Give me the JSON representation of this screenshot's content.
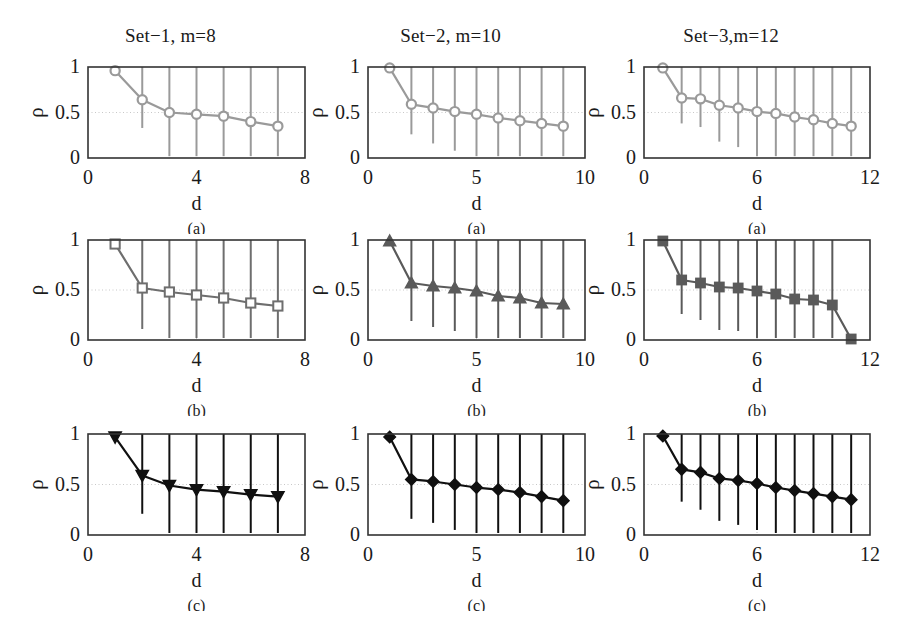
{
  "figure": {
    "background": "#ffffff",
    "rows": [
      "(a)",
      "(b)",
      "(c)"
    ],
    "columns": 3
  },
  "chart_data": [
    {
      "id": "panel-a1",
      "type": "line",
      "title": "Set−1, m=8",
      "subcaption": "(a)",
      "xlabel": "d",
      "ylabel": "ρ",
      "xlim": [
        0,
        8
      ],
      "ylim": [
        0,
        1
      ],
      "xticks": [
        0,
        4,
        8
      ],
      "xticklabels": [
        "0",
        "4",
        "8"
      ],
      "yticks": [
        0,
        0.5,
        1
      ],
      "yticklabels": [
        "0",
        "0.5",
        "1"
      ],
      "grid": true,
      "marker": "circle-open",
      "color": "#9a9a9a",
      "x": [
        1,
        2,
        3,
        4,
        5,
        6,
        7
      ],
      "values": [
        0.96,
        0.64,
        0.5,
        0.48,
        0.46,
        0.4,
        0.35
      ],
      "err_low": [
        0.93,
        0.33,
        0.02,
        0.02,
        0.02,
        0.02,
        0.02
      ],
      "err_high": [
        1.0,
        1.0,
        1.0,
        1.0,
        1.0,
        1.0,
        1.0
      ]
    },
    {
      "id": "panel-a2",
      "type": "line",
      "title": "Set−2, m=10",
      "subcaption": "(a)",
      "xlabel": "d",
      "ylabel": "ρ",
      "xlim": [
        0,
        10
      ],
      "ylim": [
        0,
        1
      ],
      "xticks": [
        0,
        5,
        10
      ],
      "xticklabels": [
        "0",
        "5",
        "10"
      ],
      "yticks": [
        0,
        0.5,
        1
      ],
      "yticklabels": [
        "0",
        "0.5",
        "1"
      ],
      "grid": true,
      "marker": "circle-open",
      "color": "#9a9a9a",
      "x": [
        1,
        2,
        3,
        4,
        5,
        6,
        7,
        8,
        9
      ],
      "values": [
        0.99,
        0.59,
        0.55,
        0.51,
        0.48,
        0.44,
        0.41,
        0.38,
        0.35
      ],
      "err_low": [
        0.97,
        0.26,
        0.16,
        0.08,
        0.02,
        0.02,
        0.02,
        0.02,
        0.02
      ],
      "err_high": [
        1.0,
        1.0,
        1.0,
        1.0,
        1.0,
        1.0,
        1.0,
        1.0,
        1.0
      ]
    },
    {
      "id": "panel-a3",
      "type": "line",
      "title": "Set−3,m=12",
      "subcaption": "(a)",
      "xlabel": "d",
      "ylabel": "ρ",
      "xlim": [
        0,
        12
      ],
      "ylim": [
        0,
        1
      ],
      "xticks": [
        0,
        6,
        12
      ],
      "xticklabels": [
        "0",
        "6",
        "12"
      ],
      "yticks": [
        0,
        0.5,
        1
      ],
      "yticklabels": [
        "0",
        "0.5",
        "1"
      ],
      "grid": true,
      "marker": "circle-open",
      "color": "#9a9a9a",
      "x": [
        1,
        2,
        3,
        4,
        5,
        6,
        7,
        8,
        9,
        10,
        11
      ],
      "values": [
        0.99,
        0.66,
        0.65,
        0.58,
        0.55,
        0.51,
        0.49,
        0.45,
        0.42,
        0.38,
        0.35
      ],
      "err_low": [
        0.97,
        0.38,
        0.34,
        0.18,
        0.12,
        0.02,
        0.02,
        0.02,
        0.02,
        0.02,
        0.02
      ],
      "err_high": [
        1.0,
        1.0,
        1.0,
        1.0,
        1.0,
        1.0,
        1.0,
        1.0,
        1.0,
        1.0,
        1.0
      ]
    },
    {
      "id": "panel-b1",
      "type": "line",
      "title": "",
      "subcaption": "(b)",
      "xlabel": "d",
      "ylabel": "ρ",
      "xlim": [
        0,
        8
      ],
      "ylim": [
        0,
        1
      ],
      "xticks": [
        0,
        4,
        8
      ],
      "xticklabels": [
        "0",
        "4",
        "8"
      ],
      "yticks": [
        0,
        0.5,
        1
      ],
      "yticklabels": [
        "0",
        "0.5",
        "1"
      ],
      "grid": true,
      "marker": "square-open",
      "color": "#6e6e6e",
      "x": [
        1,
        2,
        3,
        4,
        5,
        6,
        7
      ],
      "values": [
        0.96,
        0.52,
        0.48,
        0.45,
        0.42,
        0.37,
        0.34
      ],
      "err_low": [
        0.94,
        0.11,
        0.02,
        0.02,
        0.02,
        0.02,
        0.02
      ],
      "err_high": [
        1.0,
        1.0,
        1.0,
        1.0,
        1.0,
        1.0,
        1.0
      ]
    },
    {
      "id": "panel-b2",
      "type": "line",
      "title": "",
      "subcaption": "(b)",
      "xlabel": "d",
      "ylabel": "ρ",
      "xlim": [
        0,
        10
      ],
      "ylim": [
        0,
        1
      ],
      "xticks": [
        0,
        5,
        10
      ],
      "xticklabels": [
        "0",
        "5",
        "10"
      ],
      "yticks": [
        0,
        0.5,
        1
      ],
      "yticklabels": [
        "0",
        "0.5",
        "1"
      ],
      "grid": true,
      "marker": "triangle-up-filled",
      "color": "#5a5a5a",
      "x": [
        1,
        2,
        3,
        4,
        5,
        6,
        7,
        8,
        9
      ],
      "values": [
        0.99,
        0.57,
        0.54,
        0.52,
        0.49,
        0.44,
        0.42,
        0.37,
        0.36
      ],
      "err_low": [
        0.97,
        0.19,
        0.13,
        0.09,
        0.02,
        0.02,
        0.02,
        0.02,
        0.02
      ],
      "err_high": [
        1.0,
        1.0,
        1.0,
        1.0,
        1.0,
        1.0,
        1.0,
        1.0,
        1.0
      ]
    },
    {
      "id": "panel-b3",
      "type": "line",
      "title": "",
      "subcaption": "(b)",
      "xlabel": "d",
      "ylabel": "ρ",
      "xlim": [
        0,
        12
      ],
      "ylim": [
        0,
        1
      ],
      "xticks": [
        0,
        6,
        12
      ],
      "xticklabels": [
        "0",
        "6",
        "12"
      ],
      "yticks": [
        0,
        0.5,
        1
      ],
      "yticklabels": [
        "0",
        "0.5",
        "1"
      ],
      "grid": true,
      "marker": "square-filled",
      "color": "#5a5a5a",
      "x": [
        1,
        2,
        3,
        4,
        5,
        6,
        7,
        8,
        9,
        10,
        11
      ],
      "values": [
        0.99,
        0.6,
        0.57,
        0.53,
        0.52,
        0.49,
        0.46,
        0.41,
        0.4,
        0.35,
        0.01
      ],
      "err_low": [
        0.97,
        0.26,
        0.2,
        0.1,
        0.09,
        0.02,
        0.02,
        0.02,
        0.02,
        0.02,
        0.01
      ],
      "err_high": [
        1.0,
        1.0,
        1.0,
        1.0,
        1.0,
        1.0,
        1.0,
        1.0,
        1.0,
        1.0,
        0.01
      ]
    },
    {
      "id": "panel-c1",
      "type": "line",
      "title": "",
      "subcaption": "(c)",
      "xlabel": "d",
      "ylabel": "ρ",
      "xlim": [
        0,
        8
      ],
      "ylim": [
        0,
        1
      ],
      "xticks": [
        0,
        4,
        8
      ],
      "xticklabels": [
        "0",
        "4",
        "8"
      ],
      "yticks": [
        0,
        0.5,
        1
      ],
      "yticklabels": [
        "0",
        "0.5",
        "1"
      ],
      "grid": true,
      "marker": "triangle-down-filled",
      "color": "#101010",
      "x": [
        1,
        2,
        3,
        4,
        5,
        6,
        7
      ],
      "values": [
        0.97,
        0.59,
        0.49,
        0.45,
        0.43,
        0.4,
        0.38
      ],
      "err_low": [
        0.95,
        0.21,
        0.02,
        0.02,
        0.02,
        0.02,
        0.02
      ],
      "err_high": [
        1.0,
        1.0,
        1.0,
        1.0,
        1.0,
        1.0,
        1.0
      ]
    },
    {
      "id": "panel-c2",
      "type": "line",
      "title": "",
      "subcaption": "(c)",
      "xlabel": "d",
      "ylabel": "ρ",
      "xlim": [
        0,
        10
      ],
      "ylim": [
        0,
        1
      ],
      "xticks": [
        0,
        5,
        10
      ],
      "xticklabels": [
        "0",
        "5",
        "10"
      ],
      "yticks": [
        0,
        0.5,
        1
      ],
      "yticklabels": [
        "0",
        "0.5",
        "1"
      ],
      "grid": true,
      "marker": "diamond-filled",
      "color": "#101010",
      "x": [
        1,
        2,
        3,
        4,
        5,
        6,
        7,
        8,
        9
      ],
      "values": [
        0.97,
        0.55,
        0.53,
        0.5,
        0.47,
        0.45,
        0.42,
        0.38,
        0.34
      ],
      "err_low": [
        0.95,
        0.16,
        0.12,
        0.05,
        0.02,
        0.02,
        0.02,
        0.02,
        0.02
      ],
      "err_high": [
        1.0,
        1.0,
        1.0,
        1.0,
        1.0,
        1.0,
        1.0,
        1.0,
        1.0
      ]
    },
    {
      "id": "panel-c3",
      "type": "line",
      "title": "",
      "subcaption": "(c)",
      "xlabel": "d",
      "ylabel": "ρ",
      "xlim": [
        0,
        12
      ],
      "ylim": [
        0,
        1
      ],
      "xticks": [
        0,
        6,
        12
      ],
      "xticklabels": [
        "0",
        "6",
        "12"
      ],
      "yticks": [
        0,
        0.5,
        1
      ],
      "yticklabels": [
        "0",
        "0.5",
        "1"
      ],
      "grid": true,
      "marker": "diamond-filled",
      "color": "#101010",
      "x": [
        1,
        2,
        3,
        4,
        5,
        6,
        7,
        8,
        9,
        10,
        11
      ],
      "values": [
        0.98,
        0.65,
        0.62,
        0.56,
        0.54,
        0.51,
        0.47,
        0.44,
        0.41,
        0.38,
        0.35
      ],
      "err_low": [
        0.96,
        0.33,
        0.25,
        0.14,
        0.1,
        0.05,
        0.02,
        0.02,
        0.02,
        0.02,
        0.02
      ],
      "err_high": [
        1.0,
        1.0,
        1.0,
        1.0,
        1.0,
        1.0,
        1.0,
        1.0,
        1.0,
        1.0,
        1.0
      ]
    }
  ],
  "layout": {
    "panel_boxes": [
      {
        "id": "panel-a1",
        "left": 88,
        "top": 67,
        "width": 217,
        "height": 91
      },
      {
        "id": "panel-a2",
        "left": 368,
        "top": 67,
        "width": 217,
        "height": 91
      },
      {
        "id": "panel-a3",
        "left": 644,
        "top": 67,
        "width": 226,
        "height": 91
      },
      {
        "id": "panel-b1",
        "left": 88,
        "top": 240,
        "width": 217,
        "height": 100
      },
      {
        "id": "panel-b2",
        "left": 368,
        "top": 240,
        "width": 217,
        "height": 100
      },
      {
        "id": "panel-b3",
        "left": 644,
        "top": 240,
        "width": 226,
        "height": 100
      },
      {
        "id": "panel-c1",
        "left": 88,
        "top": 434,
        "width": 217,
        "height": 101
      },
      {
        "id": "panel-c2",
        "left": 368,
        "top": 434,
        "width": 217,
        "height": 101
      },
      {
        "id": "panel-c3",
        "left": 644,
        "top": 434,
        "width": 226,
        "height": 101
      }
    ]
  }
}
